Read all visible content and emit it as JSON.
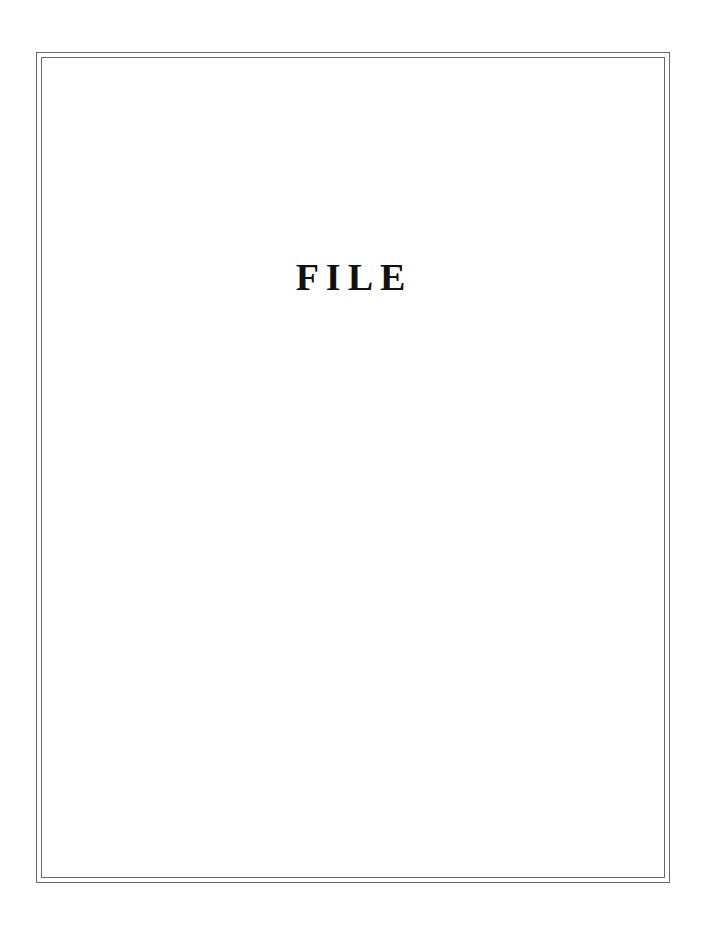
{
  "page": {
    "title": "FILE"
  },
  "colors": {
    "border": "#6a6a6a",
    "text": "#111111",
    "background": "#ffffff"
  }
}
